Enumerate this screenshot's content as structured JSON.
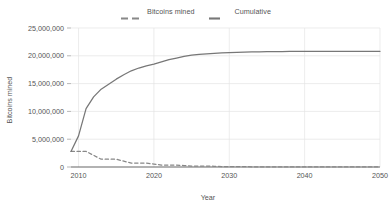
{
  "chart_data": {
    "type": "line",
    "title": "",
    "xlabel": "Year",
    "ylabel": "Bitcoins mined",
    "xlim": [
      2009,
      2050
    ],
    "ylim": [
      0,
      25000000
    ],
    "grid": true,
    "legend_position": "top-center",
    "x_ticks": [
      "2010",
      "2020",
      "2030",
      "2040",
      "2050"
    ],
    "x_tick_values": [
      2010,
      2020,
      2030,
      2040,
      2050
    ],
    "y_ticks": [
      "0",
      "5,000,000",
      "10,000,000",
      "15,000,000",
      "20,000,000",
      "25,000,000"
    ],
    "y_tick_values": [
      0,
      5000000,
      10000000,
      15000000,
      20000000,
      25000000
    ],
    "x": [
      2009,
      2010,
      2011,
      2012,
      2013,
      2014,
      2015,
      2016,
      2017,
      2018,
      2019,
      2020,
      2021,
      2022,
      2023,
      2024,
      2025,
      2026,
      2027,
      2028,
      2029,
      2030,
      2031,
      2032,
      2033,
      2034,
      2035,
      2036,
      2037,
      2038,
      2039,
      2040,
      2041,
      2042,
      2043,
      2044,
      2045,
      2046,
      2047,
      2048,
      2049,
      2050
    ],
    "series": [
      {
        "name": "Bitcoins mined",
        "style": "dashed",
        "color": "#888888",
        "values": [
          2800000,
          2800000,
          2800000,
          2100000,
          1400000,
          1400000,
          1400000,
          1050000,
          700000,
          700000,
          700000,
          525000,
          350000,
          350000,
          350000,
          262500,
          175000,
          175000,
          175000,
          131250,
          87500,
          87500,
          87500,
          65000,
          44000,
          44000,
          44000,
          33000,
          22000,
          22000,
          22000,
          16000,
          11000,
          11000,
          11000,
          8000,
          5500,
          5500,
          5500,
          4000,
          2700,
          2700
        ]
      },
      {
        "name": "Cumulative",
        "style": "solid",
        "color": "#777777",
        "values": [
          2800000,
          5600000,
          10500000,
          12600000,
          14000000,
          14900000,
          15800000,
          16600000,
          17300000,
          17800000,
          18200000,
          18500000,
          18900000,
          19300000,
          19600000,
          19900000,
          20100000,
          20250000,
          20350000,
          20450000,
          20520000,
          20580000,
          20630000,
          20670000,
          20700000,
          20720000,
          20740000,
          20755000,
          20765000,
          20775000,
          20782000,
          20788000,
          20792000,
          20795000,
          20797000,
          20799000,
          20800000,
          20801000,
          20802000,
          20803000,
          20804000,
          20805000
        ]
      }
    ]
  },
  "legend": {
    "entries": [
      {
        "label": "Bitcoins mined",
        "style": "dashed",
        "color": "#888888"
      },
      {
        "label": "Cumulative",
        "style": "solid",
        "color": "#777777"
      }
    ]
  },
  "axes": {
    "x_title": "Year",
    "y_title": "Bitcoins mined"
  },
  "colors": {
    "background": "#ffffff",
    "text": "#555555",
    "grid": "#e4e4e4",
    "axis": "#666666",
    "series_dashed": "#888888",
    "series_solid": "#777777"
  }
}
